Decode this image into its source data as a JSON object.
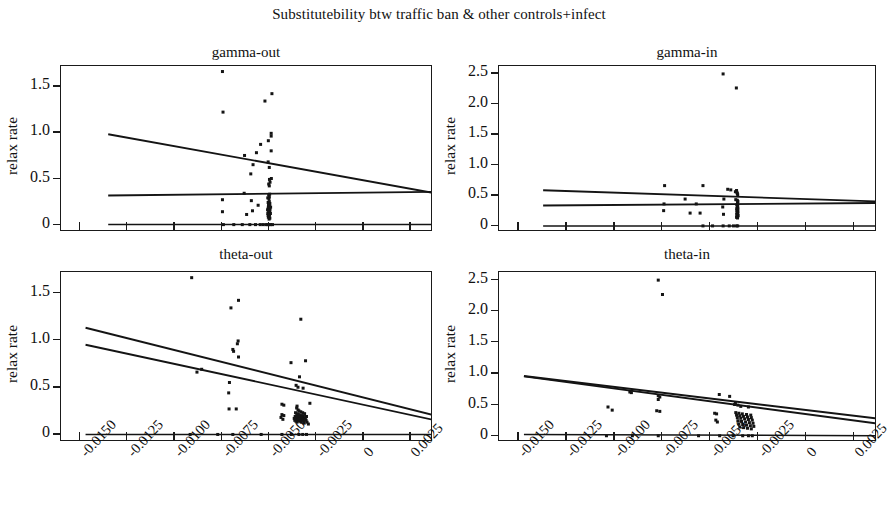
{
  "figure": {
    "title": "Substitutebility btw traffic ban & other controls+infect",
    "width": 878,
    "height": 511,
    "ylabel": "relax rate",
    "accent_color": "#141414",
    "background_color": "#ffffff"
  },
  "chart_data": [
    {
      "type": "scatter",
      "title": "gamma-out",
      "panel": "top-left",
      "xlabel": "",
      "ylabel": "relax rate",
      "xlim": [
        -0.016,
        0.0037
      ],
      "ylim": [
        -0.08,
        1.72
      ],
      "grid": false,
      "legend": "none",
      "xticks": [
        -0.015,
        -0.0125,
        -0.01,
        -0.0075,
        -0.005,
        -0.0025,
        0,
        0.0025
      ],
      "xticklabels": [
        "-0.0150",
        "-0.0125",
        "-0.0100",
        "-0.0075",
        "-0.0050",
        "-0.0025",
        "0",
        "0.0025"
      ],
      "yticks": [
        0,
        0.5,
        1.0,
        1.5
      ],
      "yticklabels": [
        "0",
        "0.5",
        "1.0",
        "1.5"
      ],
      "points": [
        [
          -0.00745,
          1.66
        ],
        [
          -0.00483,
          1.42
        ],
        [
          -0.0052,
          1.34
        ],
        [
          -0.00742,
          1.22
        ],
        [
          -0.00487,
          0.99
        ],
        [
          -0.00487,
          0.96
        ],
        [
          -0.00502,
          0.91
        ],
        [
          -0.00543,
          0.87
        ],
        [
          -0.00487,
          0.8
        ],
        [
          -0.00565,
          0.78
        ],
        [
          -0.00628,
          0.75
        ],
        [
          -0.00503,
          0.68
        ],
        [
          -0.00583,
          0.65
        ],
        [
          -0.00497,
          0.62
        ],
        [
          -0.00595,
          0.55
        ],
        [
          -0.00486,
          0.5
        ],
        [
          -0.00496,
          0.49
        ],
        [
          -0.00493,
          0.46
        ],
        [
          -0.005,
          0.44
        ],
        [
          -0.00497,
          0.42
        ],
        [
          -0.0063,
          0.34
        ],
        [
          -0.00495,
          0.33
        ],
        [
          -0.005,
          0.32
        ],
        [
          -0.00497,
          0.3
        ],
        [
          -0.00505,
          0.29
        ],
        [
          -0.00499,
          0.28
        ],
        [
          -0.00745,
          0.27
        ],
        [
          -0.00592,
          0.26
        ],
        [
          -0.00497,
          0.25
        ],
        [
          -0.00503,
          0.24
        ],
        [
          -0.00494,
          0.23
        ],
        [
          -0.00498,
          0.22
        ],
        [
          -0.00556,
          0.21
        ],
        [
          -0.00501,
          0.21
        ],
        [
          -0.00495,
          0.2
        ],
        [
          -0.00502,
          0.19
        ],
        [
          -0.0049,
          0.19
        ],
        [
          -0.00499,
          0.18
        ],
        [
          -0.00496,
          0.18
        ],
        [
          -0.00503,
          0.17
        ],
        [
          -0.00493,
          0.17
        ],
        [
          -0.005,
          0.16
        ],
        [
          -0.00506,
          0.16
        ],
        [
          -0.00497,
          0.15
        ],
        [
          -0.00586,
          0.15
        ],
        [
          -0.00745,
          0.14
        ],
        [
          -0.00494,
          0.14
        ],
        [
          -0.00501,
          0.13
        ],
        [
          -0.00498,
          0.13
        ],
        [
          -0.00505,
          0.12
        ],
        [
          -0.00491,
          0.12
        ],
        [
          -0.00499,
          0.11
        ],
        [
          -0.00617,
          0.11
        ],
        [
          -0.00503,
          0.1
        ],
        [
          -0.00496,
          0.1
        ],
        [
          -0.005,
          0.09
        ],
        [
          -0.00502,
          0.08
        ],
        [
          -0.00494,
          0.07
        ],
        [
          -0.00498,
          0.06
        ],
        [
          -0.0074,
          0.0
        ],
        [
          -0.00685,
          0.0
        ],
        [
          -0.0064,
          0.0
        ],
        [
          -0.006,
          0.0
        ],
        [
          -0.0057,
          0.0
        ],
        [
          -0.00545,
          0.0
        ],
        [
          -0.0053,
          0.0
        ],
        [
          -0.00515,
          0.0
        ],
        [
          -0.00505,
          0.0
        ],
        [
          -0.00498,
          0.0
        ],
        [
          -0.0049,
          0.0
        ],
        [
          -0.0048,
          0.0
        ]
      ],
      "lines": [
        {
          "name": "upper-fit",
          "x1": -0.0135,
          "y1": 0.98,
          "x2": 0.0037,
          "y2": 0.345
        },
        {
          "name": "middle-fit",
          "x1": -0.0135,
          "y1": 0.315,
          "x2": 0.0037,
          "y2": 0.355
        },
        {
          "name": "zero-fit",
          "x1": -0.0135,
          "y1": 0.0,
          "x2": 0.0037,
          "y2": 0.0
        }
      ]
    },
    {
      "type": "scatter",
      "title": "gamma-in",
      "panel": "top-right",
      "xlabel": "",
      "ylabel": "relax rate",
      "xlim": [
        -0.016,
        0.0037
      ],
      "ylim": [
        -0.1,
        2.62
      ],
      "grid": false,
      "legend": "none",
      "xticks": [
        -0.015,
        -0.0125,
        -0.01,
        -0.0075,
        -0.005,
        -0.0025,
        0,
        0.0025
      ],
      "xticklabels": [
        "-0.0150",
        "-0.0125",
        "-0.0100",
        "-0.0075",
        "-0.0050",
        "-0.0025",
        "0",
        "0.0025"
      ],
      "yticks": [
        0,
        0.5,
        1.0,
        1.5,
        2.0,
        2.5
      ],
      "yticklabels": [
        "0",
        "0.5",
        "1.0",
        "1.5",
        "2.0",
        "2.5"
      ],
      "points": [
        [
          -0.00432,
          2.49
        ],
        [
          -0.00363,
          2.26
        ],
        [
          -0.00737,
          0.66
        ],
        [
          -0.00537,
          0.66
        ],
        [
          -0.00408,
          0.6
        ],
        [
          -0.00392,
          0.59
        ],
        [
          -0.00362,
          0.58
        ],
        [
          -0.00368,
          0.56
        ],
        [
          -0.0036,
          0.55
        ],
        [
          -0.00358,
          0.53
        ],
        [
          -0.00356,
          0.51
        ],
        [
          -0.0063,
          0.44
        ],
        [
          -0.00428,
          0.44
        ],
        [
          -0.00366,
          0.43
        ],
        [
          -0.00358,
          0.42
        ],
        [
          -0.00355,
          0.4
        ],
        [
          -0.00357,
          0.38
        ],
        [
          -0.0074,
          0.36
        ],
        [
          -0.00572,
          0.36
        ],
        [
          -0.0036,
          0.35
        ],
        [
          -0.00356,
          0.34
        ],
        [
          -0.00359,
          0.32
        ],
        [
          -0.00434,
          0.31
        ],
        [
          -0.00357,
          0.3
        ],
        [
          -0.00355,
          0.29
        ],
        [
          -0.00361,
          0.28
        ],
        [
          -0.00358,
          0.27
        ],
        [
          -0.00356,
          0.26
        ],
        [
          -0.00742,
          0.25
        ],
        [
          -0.0036,
          0.25
        ],
        [
          -0.00357,
          0.24
        ],
        [
          -0.00355,
          0.23
        ],
        [
          -0.00359,
          0.22
        ],
        [
          -0.00604,
          0.21
        ],
        [
          -0.00552,
          0.21
        ],
        [
          -0.00358,
          0.21
        ],
        [
          -0.00356,
          0.2
        ],
        [
          -0.00361,
          0.19
        ],
        [
          -0.0043,
          0.19
        ],
        [
          -0.00357,
          0.18
        ],
        [
          -0.00354,
          0.17
        ],
        [
          -0.00359,
          0.16
        ],
        [
          -0.00356,
          0.15
        ],
        [
          -0.00362,
          0.14
        ],
        [
          -0.00357,
          0.13
        ],
        [
          -0.00537,
          0.0
        ],
        [
          -0.00487,
          0.0
        ],
        [
          -0.00432,
          0.0
        ],
        [
          -0.004,
          0.0
        ],
        [
          -0.00378,
          0.0
        ],
        [
          -0.00362,
          0.0
        ],
        [
          -0.00356,
          0.0
        ]
      ],
      "lines": [
        {
          "name": "upper-fit",
          "x1": -0.0137,
          "y1": 0.585,
          "x2": 0.0037,
          "y2": 0.4
        },
        {
          "name": "middle-fit",
          "x1": -0.0137,
          "y1": 0.335,
          "x2": 0.0037,
          "y2": 0.375
        },
        {
          "name": "zero-fit",
          "x1": -0.0137,
          "y1": 0.0,
          "x2": 0.0037,
          "y2": 0.0
        }
      ]
    },
    {
      "type": "scatter",
      "title": "theta-out",
      "panel": "bottom-left",
      "xlabel": "",
      "ylabel": "relax rate",
      "xlim": [
        -0.016,
        0.0037
      ],
      "ylim": [
        -0.08,
        1.72
      ],
      "grid": false,
      "legend": "none",
      "xticks": [
        -0.015,
        -0.0125,
        -0.01,
        -0.0075,
        -0.005,
        -0.0025,
        0,
        0.0025
      ],
      "xticklabels": [
        "-0.0150",
        "-0.0125",
        "-0.0100",
        "-0.0075",
        "-0.0050",
        "-0.0025",
        "0",
        "0.0025"
      ],
      "yticks": [
        0,
        0.5,
        1.0,
        1.5
      ],
      "yticklabels": [
        "0",
        "0.5",
        "1.0",
        "1.5"
      ],
      "points": [
        [
          -0.00908,
          1.66
        ],
        [
          -0.0066,
          1.42
        ],
        [
          -0.007,
          1.34
        ],
        [
          -0.0033,
          1.22
        ],
        [
          -0.00662,
          0.99
        ],
        [
          -0.00666,
          0.96
        ],
        [
          -0.0069,
          0.9
        ],
        [
          -0.00686,
          0.88
        ],
        [
          -0.0066,
          0.82
        ],
        [
          -0.00305,
          0.78
        ],
        [
          -0.00382,
          0.76
        ],
        [
          -0.00855,
          0.69
        ],
        [
          -0.0088,
          0.66
        ],
        [
          -0.00337,
          0.61
        ],
        [
          -0.00708,
          0.55
        ],
        [
          -0.00355,
          0.52
        ],
        [
          -0.00345,
          0.5
        ],
        [
          -0.00318,
          0.49
        ],
        [
          -0.00712,
          0.44
        ],
        [
          -0.00282,
          0.33
        ],
        [
          -0.0043,
          0.32
        ],
        [
          -0.0042,
          0.31
        ],
        [
          -0.0035,
          0.3
        ],
        [
          -0.0071,
          0.27
        ],
        [
          -0.00672,
          0.27
        ],
        [
          -0.00352,
          0.28
        ],
        [
          -0.00345,
          0.26
        ],
        [
          -0.0034,
          0.25
        ],
        [
          -0.0033,
          0.24
        ],
        [
          -0.0032,
          0.23
        ],
        [
          -0.00358,
          0.23
        ],
        [
          -0.0031,
          0.22
        ],
        [
          -0.00346,
          0.22
        ],
        [
          -0.0043,
          0.21
        ],
        [
          -0.00338,
          0.21
        ],
        [
          -0.0042,
          0.2
        ],
        [
          -0.00352,
          0.2
        ],
        [
          -0.00326,
          0.2
        ],
        [
          -0.0036,
          0.19
        ],
        [
          -0.00342,
          0.19
        ],
        [
          -0.00316,
          0.19
        ],
        [
          -0.003,
          0.19
        ],
        [
          -0.00435,
          0.18
        ],
        [
          -0.00355,
          0.18
        ],
        [
          -0.00334,
          0.18
        ],
        [
          -0.00322,
          0.18
        ],
        [
          -0.00365,
          0.17
        ],
        [
          -0.00348,
          0.17
        ],
        [
          -0.0033,
          0.17
        ],
        [
          -0.00306,
          0.17
        ],
        [
          -0.00425,
          0.16
        ],
        [
          -0.00358,
          0.16
        ],
        [
          -0.0034,
          0.16
        ],
        [
          -0.00318,
          0.16
        ],
        [
          -0.00362,
          0.15
        ],
        [
          -0.00344,
          0.15
        ],
        [
          -0.00326,
          0.15
        ],
        [
          -0.00302,
          0.15
        ],
        [
          -0.00356,
          0.14
        ],
        [
          -0.00336,
          0.14
        ],
        [
          -0.00314,
          0.14
        ],
        [
          -0.0035,
          0.13
        ],
        [
          -0.00328,
          0.13
        ],
        [
          -0.00297,
          0.13
        ],
        [
          -0.00312,
          0.12
        ],
        [
          -0.0029,
          0.11
        ],
        [
          -0.00916,
          0.0
        ],
        [
          -0.0077,
          0.0
        ],
        [
          -0.0069,
          0.0
        ],
        [
          -0.0054,
          0.0
        ],
        [
          -0.0043,
          0.0
        ],
        [
          -0.0038,
          0.0
        ],
        [
          -0.0034,
          0.0
        ],
        [
          -0.0032,
          0.0
        ],
        [
          -0.003,
          0.0
        ]
      ],
      "lines": [
        {
          "name": "upper-fit",
          "x1": -0.0147,
          "y1": 1.13,
          "x2": 0.0037,
          "y2": 0.205
        },
        {
          "name": "lower-fit",
          "x1": -0.0147,
          "y1": 0.95,
          "x2": 0.0037,
          "y2": 0.155
        },
        {
          "name": "zero-fit",
          "x1": -0.0147,
          "y1": 0.0,
          "x2": 0.0037,
          "y2": 0.0
        }
      ]
    },
    {
      "type": "scatter",
      "title": "theta-in",
      "panel": "bottom-right",
      "xlabel": "",
      "ylabel": "relax rate",
      "xlim": [
        -0.016,
        0.0037
      ],
      "ylim": [
        -0.1,
        2.62
      ],
      "grid": false,
      "legend": "none",
      "xticks": [
        -0.015,
        -0.0125,
        -0.01,
        -0.0075,
        -0.005,
        -0.0025,
        0,
        0.0025
      ],
      "xticklabels": [
        "-0.0150",
        "-0.0125",
        "-0.0100",
        "-0.0075",
        "-0.0050",
        "-0.0025",
        "0",
        "0.0025"
      ],
      "yticks": [
        0,
        0.5,
        1.0,
        1.5,
        2.0,
        2.5
      ],
      "yticklabels": [
        "0",
        "0.5",
        "1.0",
        "1.5",
        "2.0",
        "2.5"
      ],
      "points": [
        [
          -0.0077,
          2.49
        ],
        [
          -0.00748,
          2.26
        ],
        [
          -0.00452,
          0.66
        ],
        [
          -0.00398,
          0.63
        ],
        [
          -0.0077,
          0.64
        ],
        [
          -0.00762,
          0.62
        ],
        [
          -0.00918,
          0.7
        ],
        [
          -0.0091,
          0.69
        ],
        [
          -0.0077,
          0.58
        ],
        [
          -0.00368,
          0.52
        ],
        [
          -0.00372,
          0.5
        ],
        [
          -0.00355,
          0.49
        ],
        [
          -0.0034,
          0.47
        ],
        [
          -0.003,
          0.46
        ],
        [
          -0.01032,
          0.46
        ],
        [
          -0.0101,
          0.41
        ],
        [
          -0.00778,
          0.4
        ],
        [
          -0.00762,
          0.39
        ],
        [
          -0.00476,
          0.36
        ],
        [
          -0.00466,
          0.35
        ],
        [
          -0.00366,
          0.37
        ],
        [
          -0.0035,
          0.36
        ],
        [
          -0.00332,
          0.35
        ],
        [
          -0.0031,
          0.34
        ],
        [
          -0.00288,
          0.33
        ],
        [
          -0.00362,
          0.33
        ],
        [
          -0.00345,
          0.32
        ],
        [
          -0.00326,
          0.31
        ],
        [
          -0.00305,
          0.3
        ],
        [
          -0.00285,
          0.29
        ],
        [
          -0.00358,
          0.29
        ],
        [
          -0.0034,
          0.28
        ],
        [
          -0.0032,
          0.27
        ],
        [
          -0.003,
          0.26
        ],
        [
          -0.0028,
          0.25
        ],
        [
          -0.0047,
          0.25
        ],
        [
          -0.00462,
          0.22
        ],
        [
          -0.00355,
          0.24
        ],
        [
          -0.00336,
          0.23
        ],
        [
          -0.00315,
          0.22
        ],
        [
          -0.00295,
          0.21
        ],
        [
          -0.00276,
          0.2
        ],
        [
          -0.0035,
          0.19
        ],
        [
          -0.0033,
          0.18
        ],
        [
          -0.0031,
          0.17
        ],
        [
          -0.0029,
          0.16
        ],
        [
          -0.00272,
          0.15
        ],
        [
          -0.00345,
          0.14
        ],
        [
          -0.00325,
          0.13
        ],
        [
          -0.00305,
          0.12
        ],
        [
          -0.00285,
          0.11
        ],
        [
          -0.0104,
          0.0
        ],
        [
          -0.00905,
          0.0
        ],
        [
          -0.0077,
          0.0
        ],
        [
          -0.0056,
          0.0
        ],
        [
          -0.0045,
          0.0
        ],
        [
          -0.0038,
          0.0
        ],
        [
          -0.0033,
          0.0
        ],
        [
          -0.003,
          0.0
        ],
        [
          -0.0028,
          0.0
        ]
      ],
      "lines": [
        {
          "name": "upper-fit",
          "x1": -0.0147,
          "y1": 0.955,
          "x2": 0.0037,
          "y2": 0.275
        },
        {
          "name": "lower-fit",
          "x1": -0.0147,
          "y1": 0.95,
          "x2": 0.0037,
          "y2": 0.195
        },
        {
          "name": "zero-fit",
          "x1": -0.0147,
          "y1": 0.022,
          "x2": 0.0037,
          "y2": 0.0
        }
      ]
    }
  ]
}
